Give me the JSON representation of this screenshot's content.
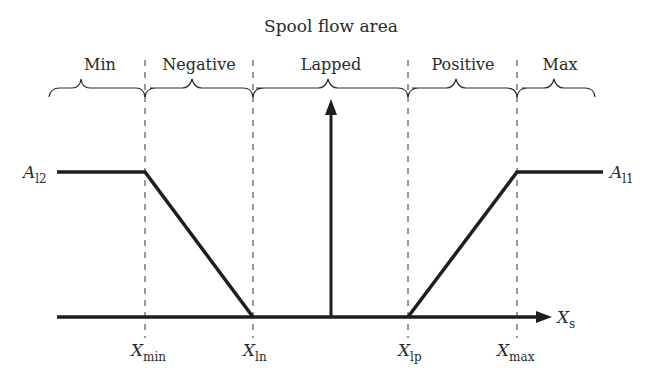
{
  "diagram": {
    "title": "Spool flow area",
    "regions": [
      {
        "label": "Min"
      },
      {
        "label": "Negative"
      },
      {
        "label": "Lapped"
      },
      {
        "label": "Positive"
      },
      {
        "label": "Max"
      }
    ],
    "levels": {
      "left": {
        "main": "A",
        "sub": "l2"
      },
      "right": {
        "main": "A",
        "sub": "l1"
      }
    },
    "axis": {
      "main": "X",
      "sub": "s"
    },
    "ticks": [
      {
        "main": "X",
        "sub": "min"
      },
      {
        "main": "X",
        "sub": "ln"
      },
      {
        "main": "X",
        "sub": "lp"
      },
      {
        "main": "X",
        "sub": "max"
      }
    ],
    "colors": {
      "line": "#1e1e1e",
      "dash": "#333333",
      "text": "#2a2a2a"
    }
  }
}
